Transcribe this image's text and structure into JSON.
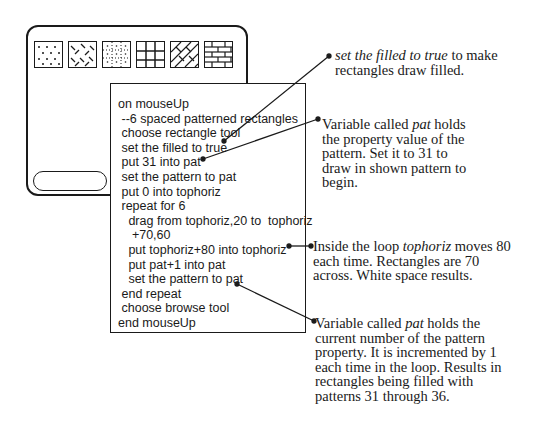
{
  "card": {
    "patterns": [
      {
        "id": 31,
        "name": "pattern-31-dots"
      },
      {
        "id": 32,
        "name": "pattern-32-dashes"
      },
      {
        "id": 33,
        "name": "pattern-33-dotted-grid"
      },
      {
        "id": 34,
        "name": "pattern-34-grid"
      },
      {
        "id": 35,
        "name": "pattern-35-diagonal-bricks"
      },
      {
        "id": 36,
        "name": "pattern-36-bricks"
      }
    ]
  },
  "script": {
    "lines": [
      "on mouseUp",
      " --6 spaced patterned rectangles",
      " choose rectangle tool",
      " set the filled to true",
      " put 31 into pat",
      " set the pattern to pat",
      " put 0 into tophoriz",
      " repeat for 6",
      "   drag from tophoriz,20 to  tophoriz",
      "    +70,60",
      "   put tophoriz+80 into tophoriz",
      "   put pat+1 into pat",
      "   set the pattern to pat",
      " end repeat",
      " choose browse tool",
      "end mouseUp"
    ]
  },
  "annotations": {
    "filled": {
      "italic": "set the filled to true",
      "rest_line1": " to make",
      "line2": "rectangles draw filled."
    },
    "pat_initial": {
      "prefix": "Variable called ",
      "italic": "pat",
      "suffix": " holds",
      "line2": "the property value of the",
      "line3": "pattern.  Set it to 31 to",
      "line4": "draw in shown pattern to",
      "line5": "begin."
    },
    "tophoriz": {
      "prefix": "Inside the loop ",
      "italic": "tophoriz",
      "suffix": " moves 80",
      "line2": "each time.  Rectangles are 70",
      "line3": "across. White space results."
    },
    "pat_increment": {
      "prefix": "Variable called  ",
      "italic": "pat",
      "suffix": "  holds the",
      "line2": "current number of the pattern",
      "line3": "property.  It is incremented by 1",
      "line4": "each time in the loop.  Results in",
      "line5": "rectangles being filled with",
      "line6": "patterns 31 through 36."
    }
  }
}
